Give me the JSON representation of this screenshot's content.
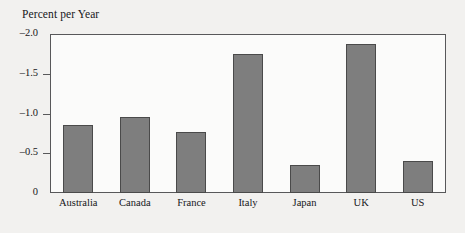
{
  "chart_data": {
    "type": "bar",
    "title": "Percent per Year",
    "xlabel": "",
    "ylabel": "Percent per Year",
    "categories": [
      "Australia",
      "Canada",
      "France",
      "Italy",
      "Japan",
      "UK",
      "US"
    ],
    "values": [
      -0.86,
      -0.95,
      -0.77,
      -1.75,
      -0.35,
      -1.87,
      -0.4
    ],
    "ytick_labels": [
      "–2.0",
      "–1.5",
      "–1.0",
      "–0.5",
      "0"
    ],
    "ytick_values": [
      -2.0,
      -1.5,
      -1.0,
      -0.5,
      0
    ],
    "ylim": [
      -2.0,
      0
    ],
    "y_axis_inverted": true,
    "grid": false,
    "legend": "none",
    "bar_color": "#7e7e7e",
    "bar_edge_color": "#4a4a4a",
    "plot_background": "#fbfbfa",
    "page_background": "#f2f1ef",
    "axis_color": "#58585a"
  }
}
